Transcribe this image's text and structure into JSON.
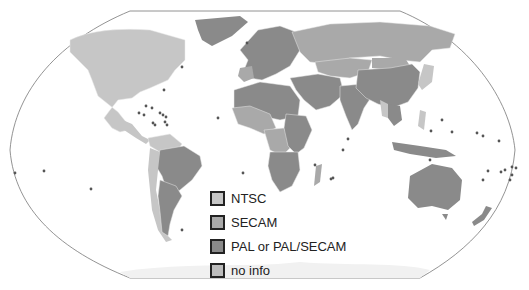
{
  "map": {
    "title": "Analog TV color systems world map",
    "projection": "Robinson-like",
    "colors": {
      "ntsc": "#c6c6c6",
      "secam": "#a9a9a9",
      "pal": "#8a8a8a",
      "no_info": "#bcbcbc",
      "border": "#e8e8e8",
      "outline": "#777777",
      "ocean": "#ffffff",
      "marker": "#555555"
    }
  },
  "legend": {
    "items": [
      {
        "label": "NTSC",
        "color": "#c6c6c6"
      },
      {
        "label": "SECAM",
        "color": "#a9a9a9"
      },
      {
        "label": "PAL or PAL/SECAM",
        "color": "#8a8a8a"
      },
      {
        "label": "no info",
        "color": "#bcbcbc"
      }
    ]
  }
}
